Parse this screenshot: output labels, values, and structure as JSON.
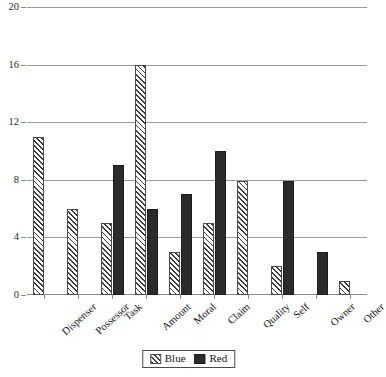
{
  "chart_data": {
    "type": "bar",
    "title": "",
    "subtitle": "",
    "xlabel": "",
    "ylabel": "",
    "ylim": [
      0,
      20
    ],
    "yticks": [
      0,
      4,
      8,
      12,
      16,
      20
    ],
    "grid": true,
    "legend_position": "bottom",
    "categories": [
      "Dispenser",
      "Possessor",
      "Task",
      "Amount",
      "Moral",
      "Claim",
      "Quality",
      "Self",
      "Owner",
      "Other"
    ],
    "series": [
      {
        "name": "Blue",
        "pattern": "diagonal-hatch",
        "values": [
          11,
          6,
          5,
          16,
          3,
          5,
          7.9,
          2,
          0,
          1
        ]
      },
      {
        "name": "Red",
        "pattern": "solid",
        "values": [
          0,
          0,
          9,
          6,
          7,
          10,
          0,
          7.9,
          3,
          0
        ]
      }
    ]
  },
  "legend": {
    "entries": [
      {
        "label": "Blue",
        "swatch": "hatched-swatch-icon"
      },
      {
        "label": "Red",
        "swatch": "solid-swatch-icon"
      }
    ]
  },
  "colors": {
    "bar_red": "#2b2b2b",
    "bar_blue_outline": "#4a4a4a",
    "gridline": "#9a9a9a",
    "axis": "#8c8c8c",
    "text": "#141414",
    "background": "#ffffff"
  }
}
